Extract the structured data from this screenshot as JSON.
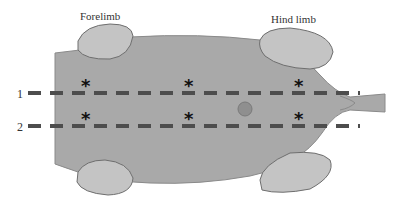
{
  "diagram": {
    "labels": {
      "forelimb": "Forelimb",
      "hind_limb": "Hind limb"
    },
    "lines": [
      {
        "id": "1",
        "label": "1"
      },
      {
        "id": "2",
        "label": "2"
      }
    ],
    "marker_symbol": "*",
    "markers_per_line": 3,
    "colors": {
      "body": "#a9a9a9",
      "body_outline": "#7a7a7a",
      "limb": "#c4c4c4",
      "limb_outline": "#6e6e6e",
      "dash_line": "#4d4d4d",
      "center_dot": "#8f8f8f",
      "text": "#333333"
    }
  }
}
